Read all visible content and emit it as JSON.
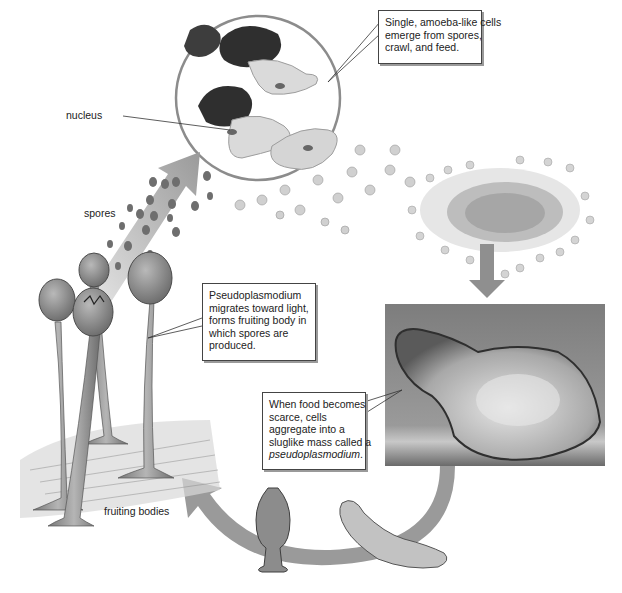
{
  "figure": {
    "colors": {
      "background": "#ffffff",
      "arrow": "#8f8f8f",
      "cell_fill": "#d2d2d2",
      "spore": "#6f6f6f",
      "photo_bg": "#8a8a8a",
      "callout_border": "#444444"
    }
  },
  "labels": {
    "nucleus": "nucleus",
    "spores": "spores",
    "fruiting_bodies": "fruiting bodies"
  },
  "callouts": {
    "amoeba": {
      "lines": [
        "Single, amoeba-like cells",
        "emerge from spores,",
        "crawl, and feed."
      ]
    },
    "migration": {
      "lines": [
        "Pseudoplasmodium",
        "migrates toward light,",
        "forms fruiting body in",
        "which spores are",
        "produced."
      ]
    },
    "aggregation": {
      "lines": [
        "When food becomes",
        "scarce, cells",
        "aggregate into a",
        "sluglike mass called a"
      ],
      "italic_term": "pseudoplasmodium",
      "trailing": "."
    }
  }
}
